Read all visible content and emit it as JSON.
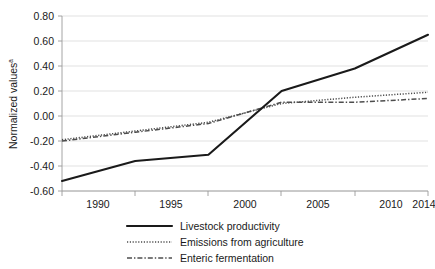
{
  "chart_data": {
    "type": "line",
    "title": "",
    "xlabel": "",
    "ylabel": "Normalized values",
    "ylabel_superscript": "a",
    "categories": [
      "1990",
      "1995",
      "2000",
      "2005",
      "2010",
      "2014"
    ],
    "ylim": [
      -0.6,
      0.8
    ],
    "yticks": [
      "0.80",
      "0.60",
      "0.40",
      "0.20",
      "0.00",
      "-0.20",
      "-0.40",
      "-0.60"
    ],
    "ytick_values": [
      0.8,
      0.6,
      0.4,
      0.2,
      0.0,
      -0.2,
      -0.4,
      -0.6
    ],
    "grid": "horizontal",
    "legend_position": "bottom",
    "series": [
      {
        "name": "Livestock productivity",
        "style": "solid",
        "color": "#1a1a1a",
        "values": [
          -0.52,
          -0.36,
          -0.31,
          0.2,
          0.38,
          0.65
        ]
      },
      {
        "name": "Emissions from agriculture",
        "style": "dotted",
        "color": "#4d4d4d",
        "values": [
          -0.19,
          -0.12,
          -0.05,
          0.1,
          0.15,
          0.19
        ]
      },
      {
        "name": "Enteric fermentation",
        "style": "dashdot",
        "color": "#4d4d4d",
        "values": [
          -0.2,
          -0.13,
          -0.06,
          0.11,
          0.11,
          0.14
        ]
      }
    ]
  },
  "axis": {
    "y_labels": [
      "0.80",
      "0.60",
      "0.40",
      "0.20",
      "0.00",
      "-0.20",
      "-0.40",
      "-0.60"
    ],
    "x_labels": [
      "1990",
      "1995",
      "2000",
      "2005",
      "2010",
      "2014"
    ],
    "y_title": "Normalized values",
    "y_title_superscript": "a"
  },
  "legend": {
    "items": [
      {
        "label": "Livestock productivity",
        "style": "solid"
      },
      {
        "label": "Emissions from agriculture",
        "style": "dotted"
      },
      {
        "label": "Enteric fermentation",
        "style": "dashdot"
      }
    ]
  },
  "colors": {
    "grid": "#d9d9d9",
    "axis": "#9a9a9a",
    "primary_series": "#1a1a1a",
    "secondary_series": "#4d4d4d",
    "background": "#ffffff",
    "text": "#1a1a1a"
  }
}
